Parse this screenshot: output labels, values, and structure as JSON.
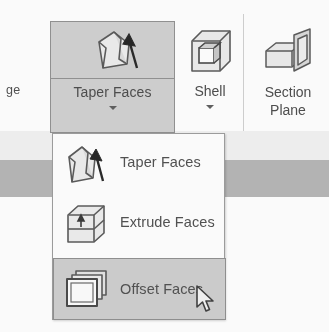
{
  "app": {
    "context": "cad-ribbon-solid-editing"
  },
  "ribbon": {
    "truncated_left_label": "ge",
    "buttons": [
      {
        "id": "taper-faces",
        "label": "Taper Faces",
        "icon": "taper-faces-icon",
        "has_dropdown": true,
        "state": "active"
      },
      {
        "id": "shell",
        "label": "Shell",
        "icon": "shell-cube-icon",
        "has_dropdown": true,
        "state": "normal"
      },
      {
        "id": "section-plane",
        "label_line1": "Section",
        "label_line2": "Plane",
        "icon": "section-plane-icon",
        "has_dropdown": false,
        "state": "normal"
      }
    ]
  },
  "dropdown": {
    "open": true,
    "owner": "taper-faces",
    "items": [
      {
        "id": "taper-faces",
        "label": "Taper Faces",
        "icon": "taper-faces-icon",
        "highlighted": false
      },
      {
        "id": "extrude-faces",
        "label": "Extrude Faces",
        "icon": "extrude-faces-icon",
        "highlighted": false
      },
      {
        "id": "offset-faces",
        "label": "Offset Faces",
        "icon": "offset-faces-icon",
        "highlighted": true
      }
    ]
  },
  "cursor": {
    "type": "arrow-pointer",
    "over": "offset-faces"
  },
  "colors": {
    "button_active_fill": "#cfcfcf",
    "button_active_border": "#8e8e8e",
    "menu_highlight_fill": "#cdcdcd",
    "menu_border": "#9a9a9a",
    "text": "#4b4b4b",
    "band_gray": "#b4b4b4",
    "band_light": "#f2f2f2",
    "icon_stroke": "#555555",
    "icon_fill": "#e8e8e8"
  }
}
